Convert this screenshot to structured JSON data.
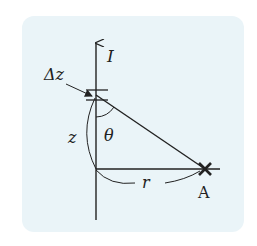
{
  "diagram": {
    "colors": {
      "background": "#eaf4f8",
      "ink": "#222222"
    },
    "labels": {
      "current": "I",
      "element": "Δz",
      "height": "z",
      "angle": "θ",
      "distance": "r",
      "point": "A"
    }
  }
}
